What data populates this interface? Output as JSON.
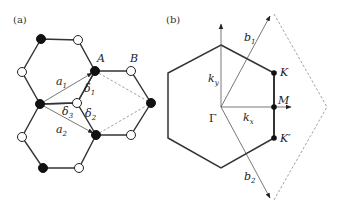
{
  "figure": {
    "panel_a": {
      "label": "(a)",
      "sublattice_labels": {
        "A": "A",
        "B": "B"
      },
      "lattice_vectors": [
        {
          "name": "a",
          "sub": "1"
        },
        {
          "name": "a",
          "sub": "2"
        }
      ],
      "nn_vectors": [
        {
          "name": "δ",
          "sub": "1"
        },
        {
          "name": "δ",
          "sub": "2"
        },
        {
          "name": "δ",
          "sub": "3"
        }
      ],
      "atom_legend": {
        "A_sites": "filled (black)",
        "B_sites": "open (white)"
      }
    },
    "panel_b": {
      "label": "(b)",
      "center_point": "Γ",
      "high_symmetry_points": [
        "K",
        "M",
        "K′"
      ],
      "axes": [
        {
          "name": "k",
          "sub": "y"
        },
        {
          "name": "k",
          "sub": "x"
        }
      ],
      "reciprocal_vectors": [
        {
          "name": "b",
          "sub": "1"
        },
        {
          "name": "b",
          "sub": "2"
        }
      ]
    },
    "colors": {
      "line": "#333333",
      "vector": "#555555",
      "dashed": "#888888",
      "atom_filled": "#111111",
      "atom_open": "#ffffff"
    }
  }
}
